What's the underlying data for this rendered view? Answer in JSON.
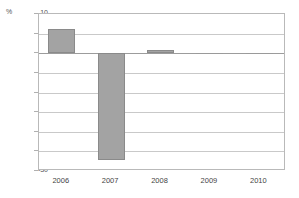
{
  "chart_data": {
    "type": "bar",
    "title": "",
    "xlabel": "",
    "ylabel": "%",
    "unit_label": "%",
    "categories": [
      "2006",
      "2007",
      "2008",
      "2009",
      "2010"
    ],
    "values": [
      6.3,
      -27.3,
      0.8,
      0.0,
      0.0
    ],
    "series": [
      {
        "name": "",
        "values": [
          6.3,
          -27.3,
          0.8,
          0.0,
          0.0
        ]
      }
    ],
    "ylim": [
      -30,
      10
    ],
    "ytick_labels": [
      "10",
      "5",
      "0",
      "-5",
      "-10",
      "-15",
      "-20",
      "-25",
      "-30"
    ],
    "ytick_values": [
      10,
      5,
      0,
      -5,
      -10,
      -15,
      -20,
      -25,
      -30
    ],
    "grid": true,
    "legend": "none",
    "bar_color": "#a3a3a3",
    "bar_border_color": "#8a8a8a",
    "gridline_color": "#c9c9c9",
    "axis_color": "#b9b9b9",
    "background_color": "#ffffff"
  }
}
